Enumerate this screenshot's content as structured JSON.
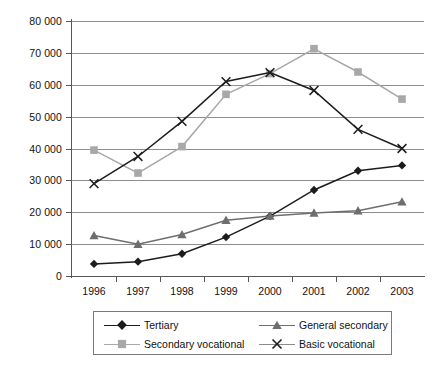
{
  "chart_data": {
    "type": "line",
    "title": "",
    "xlabel": "",
    "ylabel": "",
    "categories": [
      "1996",
      "1997",
      "1998",
      "1999",
      "2000",
      "2001",
      "2002",
      "2003"
    ],
    "ylim": [
      0,
      80000
    ],
    "ytick_labels": [
      "0",
      "10 000",
      "20 000",
      "30 000",
      "40 000",
      "50 000",
      "60 000",
      "70 000",
      "80 000"
    ],
    "ytick_values": [
      0,
      10000,
      20000,
      30000,
      40000,
      50000,
      60000,
      70000,
      80000
    ],
    "grid": true,
    "legend_position": "bottom",
    "series": [
      {
        "name": "Tertiary",
        "marker": "diamond",
        "color": "#1c1c1c",
        "values": [
          3800,
          4500,
          7000,
          12200,
          18800,
          27000,
          33000,
          34700
        ]
      },
      {
        "name": "General secondary",
        "marker": "triangle",
        "color": "#6e6e6e",
        "values": [
          12700,
          10000,
          13000,
          17500,
          18800,
          19800,
          20500,
          23300
        ]
      },
      {
        "name": "Secondary vocational",
        "marker": "square",
        "color": "#a8a8a8",
        "values": [
          39500,
          32300,
          40600,
          57000,
          63500,
          71300,
          64000,
          55500
        ]
      },
      {
        "name": "Basic vocational",
        "marker": "cross",
        "color": "#1c1c1c",
        "values": [
          29000,
          37500,
          48500,
          61000,
          63800,
          58200,
          46000,
          40000
        ]
      }
    ]
  },
  "legend": {
    "entries": [
      {
        "label": "Tertiary"
      },
      {
        "label": "General secondary"
      },
      {
        "label": "Secondary vocational"
      },
      {
        "label": "Basic vocational"
      }
    ]
  },
  "colors": {
    "grid": "#8e8e8e",
    "axis": "#575757",
    "legend_border": "#7a7a7a",
    "text": "#111111"
  }
}
